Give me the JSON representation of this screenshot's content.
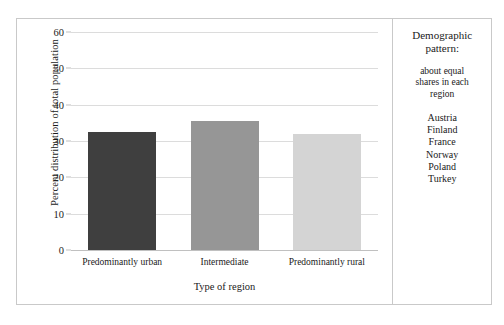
{
  "chart_data": {
    "type": "bar",
    "title": "",
    "xlabel": "Type of region",
    "ylabel": "Percent distribution of total population",
    "categories": [
      "Predominantly urban",
      "Intermediate",
      "Predominantly rural"
    ],
    "values": [
      32.4,
      35.5,
      31.8
    ],
    "colors": [
      "#3f3f3f",
      "#969696",
      "#d4d4d4"
    ],
    "ylim": [
      0,
      60
    ],
    "yticks": [
      0,
      10,
      20,
      30,
      40,
      50,
      60
    ],
    "ytick_labels": [
      "0",
      "10",
      "20",
      "30",
      "40",
      "50",
      "60"
    ],
    "grid": true,
    "legend": "none"
  },
  "annotation": {
    "heading_line1": "Demographic",
    "heading_line2": "pattern:",
    "body_line1": "about equal",
    "body_line2": "shares in each",
    "body_line3": "region",
    "countries": [
      "Austria",
      "Finland",
      "France",
      "Norway",
      "Poland",
      "Turkey"
    ]
  }
}
